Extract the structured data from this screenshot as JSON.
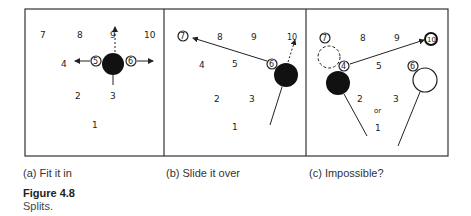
{
  "panels": [
    {
      "caption": "(a) Fit it in",
      "numbers": {
        "n1": "1",
        "n2": "2",
        "n3": "3",
        "n4": "4",
        "n5": "5",
        "n6": "6",
        "n7": "7",
        "n8": "8",
        "n9": "9",
        "n10": "10"
      }
    },
    {
      "caption": "(b) Slide it over",
      "numbers": {
        "n1": "1",
        "n2": "2",
        "n3": "3",
        "n4": "4",
        "n5": "5",
        "n6": "6",
        "n7": "7",
        "n8": "8",
        "n9": "9",
        "n10": "10"
      }
    },
    {
      "caption": "(c) Impossible?",
      "numbers": {
        "n1": "1",
        "n2": "2",
        "n3": "3",
        "n4": "4",
        "n5": "5",
        "n6": "6",
        "n7": "7",
        "n8": "8",
        "n9": "9",
        "n10": "10"
      },
      "or_label": "or"
    }
  ],
  "figure": {
    "label": "Figure 4.8",
    "description": "Splits."
  }
}
